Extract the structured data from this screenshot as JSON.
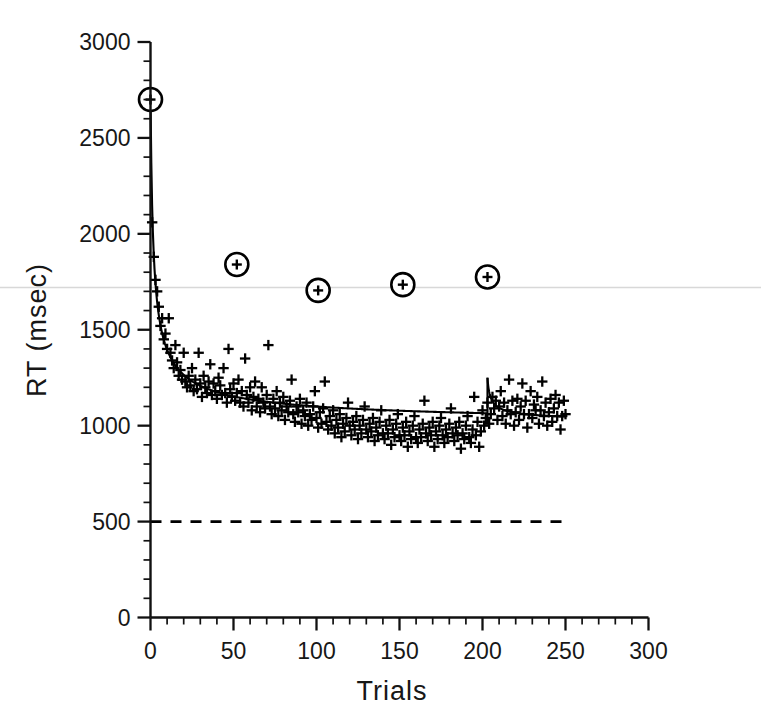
{
  "chart_data": {
    "type": "scatter",
    "title": "",
    "subtitle": "",
    "xlabel": "Trials",
    "ylabel": "RT (msec)",
    "xlim": [
      0,
      300
    ],
    "ylim": [
      0,
      3000
    ],
    "x_major_ticks": [
      0,
      50,
      100,
      150,
      200,
      250,
      300
    ],
    "x_tick_labels": [
      "0",
      "50",
      "100",
      "150",
      "200",
      "250",
      "300"
    ],
    "x_minor_step": 10,
    "y_major_ticks": [
      0,
      500,
      1000,
      1500,
      2000,
      2500,
      3000
    ],
    "y_tick_labels": [
      "0",
      "500",
      "1000",
      "1500",
      "2000",
      "2500",
      "3000"
    ],
    "y_minor_step": 100,
    "grid": false,
    "legend": "none",
    "marker_style": "plus",
    "series": [
      {
        "name": "Reaction time per trial",
        "marker": "plus",
        "x": [
          1,
          2,
          3,
          4,
          5,
          6,
          7,
          8,
          9,
          10,
          11,
          12,
          13,
          14,
          15,
          16,
          17,
          18,
          19,
          20,
          21,
          22,
          23,
          24,
          25,
          26,
          27,
          28,
          29,
          30,
          31,
          32,
          33,
          34,
          35,
          36,
          37,
          38,
          39,
          40,
          41,
          42,
          43,
          44,
          45,
          46,
          47,
          48,
          49,
          50,
          51,
          52,
          53,
          54,
          55,
          56,
          57,
          58,
          59,
          60,
          61,
          62,
          63,
          64,
          65,
          66,
          67,
          68,
          69,
          70,
          71,
          72,
          73,
          74,
          75,
          76,
          77,
          78,
          79,
          80,
          81,
          82,
          83,
          84,
          85,
          86,
          87,
          88,
          89,
          90,
          91,
          92,
          93,
          94,
          95,
          96,
          97,
          98,
          99,
          100,
          101,
          102,
          103,
          104,
          105,
          106,
          107,
          108,
          109,
          110,
          111,
          112,
          113,
          114,
          115,
          116,
          117,
          118,
          119,
          120,
          121,
          122,
          123,
          124,
          125,
          126,
          127,
          128,
          129,
          130,
          131,
          132,
          133,
          134,
          135,
          136,
          137,
          138,
          139,
          140,
          141,
          142,
          143,
          144,
          145,
          146,
          147,
          148,
          149,
          150,
          151,
          152,
          153,
          154,
          155,
          156,
          157,
          158,
          159,
          160,
          161,
          162,
          163,
          164,
          165,
          166,
          167,
          168,
          169,
          170,
          171,
          172,
          173,
          174,
          175,
          176,
          177,
          178,
          179,
          180,
          181,
          182,
          183,
          184,
          185,
          186,
          187,
          188,
          189,
          190,
          191,
          192,
          193,
          194,
          195,
          196,
          197,
          198,
          199,
          200,
          201,
          202,
          203,
          204,
          205,
          206,
          207,
          208,
          209,
          210,
          211,
          212,
          213,
          214,
          215,
          216,
          217,
          218,
          219,
          220,
          221,
          222,
          223,
          224,
          225,
          226,
          227,
          228,
          229,
          230,
          231,
          232,
          233,
          234,
          235,
          236,
          237,
          238,
          239,
          240,
          241,
          242,
          243,
          244,
          245,
          246,
          247,
          248,
          249,
          250
        ],
        "y": [
          2060,
          1880,
          1760,
          1700,
          1620,
          1520,
          1560,
          1450,
          1480,
          1400,
          1560,
          1380,
          1340,
          1300,
          1420,
          1330,
          1260,
          1290,
          1240,
          1380,
          1230,
          1200,
          1260,
          1210,
          1300,
          1180,
          1240,
          1190,
          1380,
          1220,
          1150,
          1260,
          1200,
          1170,
          1230,
          1320,
          1160,
          1220,
          1180,
          1140,
          1250,
          1210,
          1160,
          1300,
          1170,
          1120,
          1400,
          1190,
          1150,
          1220,
          1130,
          1170,
          1240,
          1120,
          1180,
          1100,
          1350,
          1160,
          1120,
          1200,
          1080,
          1150,
          1230,
          1100,
          1140,
          1070,
          1200,
          1120,
          1090,
          1160,
          1420,
          1100,
          1060,
          1140,
          1090,
          1180,
          1050,
          1120,
          1080,
          1150,
          1030,
          1100,
          1070,
          1130,
          1240,
          1060,
          1020,
          1100,
          1070,
          1140,
          1010,
          1080,
          1050,
          1120,
          1000,
          1060,
          1030,
          1100,
          1180,
          1040,
          990,
          1070,
          1010,
          1090,
          1230,
          1020,
          980,
          1050,
          1000,
          1080,
          960,
          1030,
          990,
          1060,
          940,
          1010,
          970,
          1040,
          1120,
          1000,
          950,
          1020,
          980,
          1050,
          930,
          1000,
          960,
          1030,
          1100,
          980,
          940,
          1010,
          970,
          1040,
          920,
          990,
          950,
          1020,
          1080,
          960,
          930,
          1000,
          960,
          1030,
          900,
          980,
          940,
          1010,
          1060,
          950,
          920,
          990,
          950,
          1020,
          890,
          970,
          930,
          1000,
          1050,
          940,
          910,
          980,
          940,
          1010,
          1130,
          960,
          920,
          990,
          950,
          1020,
          890,
          970,
          930,
          1000,
          1040,
          950,
          910,
          980,
          940,
          1010,
          1090,
          960,
          920,
          990,
          950,
          1020,
          880,
          960,
          930,
          1000,
          1050,
          940,
          910,
          980,
          1150,
          950,
          1020,
          890,
          970,
          1080,
          1000,
          1040,
          1120,
          1010,
          1060,
          1150,
          1090,
          1130,
          1030,
          1100,
          1180,
          1050,
          1120,
          1010,
          1080,
          1240,
          1060,
          1130,
          1000,
          1070,
          1140,
          1030,
          1100,
          1220,
          1060,
          1130,
          990,
          1060,
          1180,
          1040,
          1110,
          1080,
          1150,
          1010,
          1080,
          1230,
          1050,
          1120,
          1000,
          1070,
          1140,
          1020,
          1090,
          1160,
          1050,
          1120,
          980,
          1050,
          1130,
          1060
        ],
        "note": "approximately 250 individual trial reaction times, decaying power-law trend with scatter"
      }
    ],
    "fitted_curve": {
      "name": "Power-law learning curve fit",
      "style": "solid",
      "color": "#000000",
      "segments": [
        {
          "range": [
            0,
            203
          ],
          "form": "power-law",
          "asymptote": 1000,
          "scale": 1750,
          "exponent": 0.62,
          "y_at_start": 2700,
          "y_at_end": 1010
        },
        {
          "range": [
            203,
            250
          ],
          "form": "power-law",
          "asymptote": 1020,
          "scale": 230,
          "exponent": 0.55,
          "y_at_start": 1250,
          "y_at_end": 1060,
          "note": "discontinuous upward jump at trial 203 followed by renewed decay"
        }
      ],
      "discontinuity_at_x": 203
    },
    "circled_points": {
      "name": "Highlighted probe trials",
      "marker": "circled-plus",
      "points": [
        {
          "x": 0,
          "y": 2700
        },
        {
          "x": 52,
          "y": 1840
        },
        {
          "x": 101,
          "y": 1705
        },
        {
          "x": 152,
          "y": 1735
        },
        {
          "x": 203,
          "y": 1775
        }
      ]
    },
    "reference_lines": [
      {
        "name": "baseline",
        "orientation": "horizontal",
        "y": 500,
        "style": "dashed",
        "color": "#000000",
        "x_start": 0,
        "x_end": 250
      },
      {
        "name": "scan-artifact-line",
        "orientation": "horizontal",
        "y": 1720,
        "style": "solid",
        "color": "#d8d8d8",
        "x_start": 0,
        "x_end": 300
      }
    ]
  }
}
